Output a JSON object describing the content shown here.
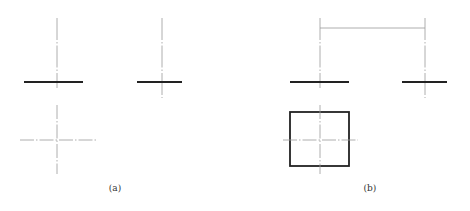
{
  "figure": {
    "panels": [
      {
        "id": "a",
        "caption": "(a)"
      },
      {
        "id": "b",
        "caption": "(b)"
      }
    ],
    "colors": {
      "object_line": "#222222",
      "center_line": "#9a9a9a",
      "dimension_line": "#9a9a9a"
    }
  }
}
